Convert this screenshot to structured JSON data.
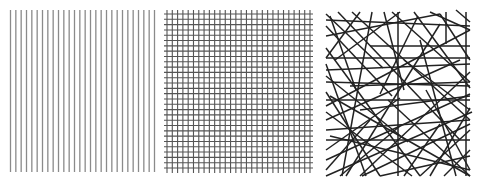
{
  "figure": {
    "width": 483,
    "height": 186,
    "background": "#ffffff",
    "panels": [
      {
        "id": "aligned",
        "label": "parallel-vertical-lines",
        "color": "#8a8a8a",
        "stroke_width": 1.3,
        "x0": 10.5,
        "x1": 154.5,
        "y0": 10,
        "y1": 172,
        "vertical_count": 28,
        "horizontal_count": 0
      },
      {
        "id": "grid",
        "label": "orthogonal-grid",
        "color": "#555555",
        "stroke_width": 1.1,
        "vx0": 167,
        "vx1": 310,
        "vy0": 10,
        "vy1": 173,
        "hx0": 164,
        "hx1": 313,
        "hy0": 14,
        "hy1": 168,
        "vertical_count": 28,
        "horizontal_count": 30
      },
      {
        "id": "random",
        "label": "random-network",
        "color": "#222222",
        "stroke_width": 1.5,
        "bounds": [
          323,
          10,
          472,
          176
        ],
        "lines": [
          [
            326,
            14,
            383,
            68
          ],
          [
            326,
            20,
            470,
            26
          ],
          [
            326,
            26,
            392,
            96
          ],
          [
            330,
            16,
            356,
            90
          ],
          [
            335,
            60,
            400,
            12
          ],
          [
            326,
            36,
            440,
            14
          ],
          [
            360,
            12,
            326,
            58
          ],
          [
            372,
            12,
            342,
            176
          ],
          [
            384,
            12,
            404,
            90
          ],
          [
            398,
            12,
            398,
            176
          ],
          [
            418,
            16,
            380,
            94
          ],
          [
            430,
            12,
            470,
            30
          ],
          [
            440,
            14,
            470,
            60
          ],
          [
            446,
            12,
            446,
            44
          ],
          [
            456,
            10,
            470,
            22
          ],
          [
            326,
            70,
            470,
            64
          ],
          [
            326,
            82,
            470,
            86
          ],
          [
            326,
            76,
            408,
            142
          ],
          [
            326,
            106,
            470,
            30
          ],
          [
            330,
            96,
            470,
            176
          ],
          [
            326,
            120,
            460,
            60
          ],
          [
            326,
            112,
            412,
            176
          ],
          [
            326,
            130,
            470,
            120
          ],
          [
            326,
            140,
            470,
            140
          ],
          [
            326,
            150,
            400,
            98
          ],
          [
            326,
            160,
            470,
            94
          ],
          [
            326,
            170,
            370,
            120
          ],
          [
            326,
            176,
            472,
            112
          ],
          [
            340,
            176,
            400,
            126
          ],
          [
            352,
            12,
            470,
            120
          ],
          [
            360,
            176,
            470,
            72
          ],
          [
            380,
            176,
            470,
            156
          ],
          [
            388,
            100,
            470,
            176
          ],
          [
            414,
            12,
            470,
            88
          ],
          [
            420,
            176,
            470,
            130
          ],
          [
            430,
            176,
            470,
            108
          ],
          [
            426,
            90,
            470,
            170
          ],
          [
            404,
            176,
            440,
            124
          ],
          [
            444,
            176,
            470,
            150
          ],
          [
            326,
            92,
            380,
            176
          ],
          [
            326,
            48,
            420,
            176
          ],
          [
            338,
            12,
            460,
            140
          ],
          [
            360,
            110,
            470,
            96
          ],
          [
            370,
            46,
            470,
            46
          ],
          [
            326,
            58,
            470,
            58
          ],
          [
            392,
            12,
            470,
            82
          ],
          [
            326,
            100,
            470,
            100
          ],
          [
            404,
            60,
            470,
            110
          ],
          [
            330,
            136,
            470,
            170
          ],
          [
            466,
            12,
            466,
            176
          ],
          [
            346,
            176,
            440,
            24
          ],
          [
            362,
            176,
            470,
            124
          ],
          [
            350,
            86,
            470,
            82
          ],
          [
            326,
            64,
            366,
            176
          ],
          [
            420,
            40,
            456,
            176
          ]
        ]
      }
    ]
  }
}
